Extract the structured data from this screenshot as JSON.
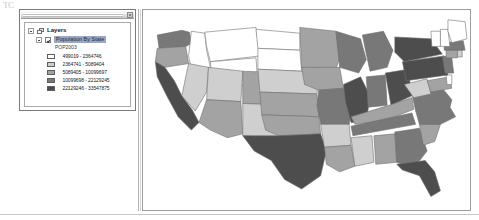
{
  "artifact": {
    "text": "TC"
  },
  "toc_panel": {
    "close_label": "×",
    "tree": {
      "root_label": "Layers",
      "layer_label": "Population By State",
      "field_label": "POP2003"
    }
  },
  "legend": {
    "title": "POP2003",
    "classes": [
      {
        "label": "499019 - 2364746",
        "color": "#ffffff"
      },
      {
        "label": "2364741 - 5089404",
        "color": "#cfcfcf"
      },
      {
        "label": "5089405 - 10099697",
        "color": "#a3a3a3"
      },
      {
        "label": "10099698 - 22129245",
        "color": "#787878"
      },
      {
        "label": "22129246 - 33547875",
        "color": "#4d4d4d"
      }
    ]
  },
  "chart_data": {
    "type": "choropleth",
    "title": "Population By State",
    "field": "POP2003",
    "legend_position": "left-panel",
    "classification": "graduated-color-5-class",
    "color_ramp": [
      "#ffffff",
      "#cfcfcf",
      "#a3a3a3",
      "#787878",
      "#4d4d4d"
    ],
    "class_breaks": [
      {
        "min": 499019,
        "max": 2364746,
        "label": "499019 - 2364746",
        "color": "#ffffff"
      },
      {
        "min": 2364741,
        "max": 5089404,
        "label": "2364741 - 5089404",
        "color": "#cfcfcf"
      },
      {
        "min": 5089405,
        "max": 10099697,
        "label": "5089405 - 10099697",
        "color": "#a3a3a3"
      },
      {
        "min": 10099698,
        "max": 22129245,
        "label": "10099698 - 22129245",
        "color": "#787878"
      },
      {
        "min": 22129246,
        "max": 33547875,
        "label": "22129246 - 33547875",
        "color": "#4d4d4d"
      }
    ],
    "features": [
      {
        "name": "Washington",
        "class": 4,
        "color": "#787878"
      },
      {
        "name": "Oregon",
        "class": 3,
        "color": "#a3a3a3"
      },
      {
        "name": "California",
        "class": 5,
        "color": "#4d4d4d"
      },
      {
        "name": "Idaho",
        "class": 1,
        "color": "#ffffff"
      },
      {
        "name": "Nevada",
        "class": 2,
        "color": "#cfcfcf"
      },
      {
        "name": "Montana",
        "class": 1,
        "color": "#ffffff"
      },
      {
        "name": "Wyoming",
        "class": 1,
        "color": "#ffffff"
      },
      {
        "name": "Utah",
        "class": 2,
        "color": "#cfcfcf"
      },
      {
        "name": "Arizona",
        "class": 3,
        "color": "#a3a3a3"
      },
      {
        "name": "Colorado",
        "class": 3,
        "color": "#a3a3a3"
      },
      {
        "name": "New Mexico",
        "class": 2,
        "color": "#cfcfcf"
      },
      {
        "name": "North Dakota",
        "class": 1,
        "color": "#ffffff"
      },
      {
        "name": "South Dakota",
        "class": 1,
        "color": "#ffffff"
      },
      {
        "name": "Nebraska",
        "class": 2,
        "color": "#cfcfcf"
      },
      {
        "name": "Kansas",
        "class": 3,
        "color": "#a3a3a3"
      },
      {
        "name": "Oklahoma",
        "class": 3,
        "color": "#a3a3a3"
      },
      {
        "name": "Texas",
        "class": 5,
        "color": "#4d4d4d"
      },
      {
        "name": "Minnesota",
        "class": 3,
        "color": "#a3a3a3"
      },
      {
        "name": "Iowa",
        "class": 3,
        "color": "#a3a3a3"
      },
      {
        "name": "Missouri",
        "class": 4,
        "color": "#787878"
      },
      {
        "name": "Arkansas",
        "class": 2,
        "color": "#cfcfcf"
      },
      {
        "name": "Louisiana",
        "class": 3,
        "color": "#a3a3a3"
      },
      {
        "name": "Wisconsin",
        "class": 4,
        "color": "#787878"
      },
      {
        "name": "Illinois",
        "class": 5,
        "color": "#4d4d4d"
      },
      {
        "name": "Michigan",
        "class": 4,
        "color": "#787878"
      },
      {
        "name": "Indiana",
        "class": 4,
        "color": "#787878"
      },
      {
        "name": "Ohio",
        "class": 5,
        "color": "#4d4d4d"
      },
      {
        "name": "Kentucky",
        "class": 3,
        "color": "#a3a3a3"
      },
      {
        "name": "Tennessee",
        "class": 4,
        "color": "#787878"
      },
      {
        "name": "Mississippi",
        "class": 2,
        "color": "#cfcfcf"
      },
      {
        "name": "Alabama",
        "class": 3,
        "color": "#a3a3a3"
      },
      {
        "name": "Georgia",
        "class": 4,
        "color": "#787878"
      },
      {
        "name": "Florida",
        "class": 5,
        "color": "#4d4d4d"
      },
      {
        "name": "South Carolina",
        "class": 3,
        "color": "#a3a3a3"
      },
      {
        "name": "North Carolina",
        "class": 4,
        "color": "#787878"
      },
      {
        "name": "Virginia",
        "class": 4,
        "color": "#787878"
      },
      {
        "name": "West Virginia",
        "class": 2,
        "color": "#cfcfcf"
      },
      {
        "name": "Maryland",
        "class": 3,
        "color": "#a3a3a3"
      },
      {
        "name": "Delaware",
        "class": 1,
        "color": "#ffffff"
      },
      {
        "name": "Pennsylvania",
        "class": 5,
        "color": "#4d4d4d"
      },
      {
        "name": "New York",
        "class": 5,
        "color": "#4d4d4d"
      },
      {
        "name": "New Jersey",
        "class": 4,
        "color": "#787878"
      },
      {
        "name": "Connecticut",
        "class": 3,
        "color": "#a3a3a3"
      },
      {
        "name": "Rhode Island",
        "class": 2,
        "color": "#cfcfcf"
      },
      {
        "name": "Massachusetts",
        "class": 4,
        "color": "#787878"
      },
      {
        "name": "Vermont",
        "class": 1,
        "color": "#ffffff"
      },
      {
        "name": "New Hampshire",
        "class": 1,
        "color": "#ffffff"
      },
      {
        "name": "Maine",
        "class": 1,
        "color": "#ffffff"
      }
    ]
  }
}
